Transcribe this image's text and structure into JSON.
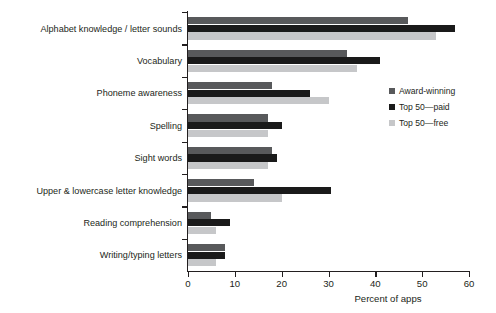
{
  "chart_data": {
    "type": "bar",
    "orientation": "horizontal",
    "title": "",
    "xlabel": "Percent of apps",
    "ylabel": "",
    "xlim": [
      0,
      60
    ],
    "xticks": [
      0,
      10,
      20,
      30,
      40,
      50,
      60
    ],
    "grid": false,
    "legend_position": "right-middle",
    "categories": [
      "Alphabet knowledge / letter sounds",
      "Vocabulary",
      "Phoneme awareness",
      "Spelling",
      "Sight words",
      "Upper & lowercase letter knowledge",
      "Reading comprehension",
      "Writing/typing letters"
    ],
    "series": [
      {
        "name": "Award-winning",
        "color": "#58595b",
        "values": [
          47,
          34,
          18,
          17,
          18,
          14,
          5,
          8
        ]
      },
      {
        "name": "Top 50—paid",
        "color": "#1a1a1a",
        "values": [
          57,
          41,
          26,
          20,
          19,
          30.5,
          9,
          8
        ]
      },
      {
        "name": "Top 50—free",
        "color": "#c6c7c9",
        "values": [
          53,
          36,
          30,
          17,
          17,
          20,
          6,
          6
        ]
      }
    ]
  },
  "legend": {
    "items": [
      {
        "label": "Award-winning",
        "color": "#58595b"
      },
      {
        "label": "Top 50—paid",
        "color": "#1a1a1a"
      },
      {
        "label": "Top 50—free",
        "color": "#c6c7c9"
      }
    ]
  }
}
